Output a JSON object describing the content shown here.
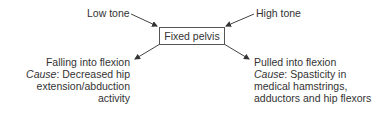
{
  "diagram": {
    "center": {
      "label": "Fixed pelvis"
    },
    "inputs": {
      "left": {
        "label": "Low tone"
      },
      "right": {
        "label": "High tone"
      }
    },
    "outcomes": {
      "left": {
        "title": "Falling into flexion",
        "cause_label": "Cause",
        "cause_lines": [
          "Decreased hip",
          "extension/abduction",
          "activity"
        ]
      },
      "right": {
        "title": "Pulled into flexion",
        "cause_label": "Cause",
        "cause_lines": [
          "Spasticity in",
          "medical hamstrings,",
          "adductors and hip flexors"
        ]
      }
    },
    "colors": {
      "text": "#333333",
      "stroke": "#444444",
      "background": "#ffffff"
    }
  }
}
